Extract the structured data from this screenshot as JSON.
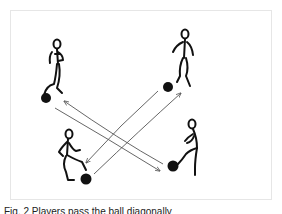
{
  "figure": {
    "caption": "Fig. 2 Players pass the ball diagonally",
    "players": [
      {
        "id": "top-left",
        "label": "player-top-left"
      },
      {
        "id": "top-right",
        "label": "player-top-right"
      },
      {
        "id": "bottom-left",
        "label": "player-bottom-left"
      },
      {
        "id": "bottom-right",
        "label": "player-bottom-right"
      }
    ],
    "balls": 4,
    "passes": [
      {
        "from": "bottom-right",
        "to": "top-left"
      },
      {
        "from": "top-left",
        "to": "bottom-right"
      },
      {
        "from": "top-right",
        "to": "bottom-left"
      },
      {
        "from": "bottom-left",
        "to": "top-right"
      }
    ],
    "colors": {
      "ink": "#111111",
      "arrow": "#555555",
      "frame": "#e6e6e6"
    }
  }
}
